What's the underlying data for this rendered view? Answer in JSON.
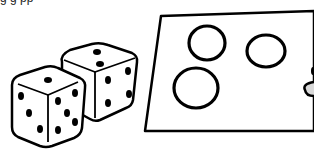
{
  "illustration": {
    "subject": "two dice next to a paper with three circles",
    "top_caption_fragment": "g g pp",
    "dice": [
      {
        "name": "front-die",
        "visible_faces": {
          "top": 1,
          "left": 3,
          "right": 5
        }
      },
      {
        "name": "back-die",
        "visible_faces": {
          "top": 2,
          "right": 4
        }
      }
    ],
    "paper": {
      "circles": 3
    },
    "colors": {
      "stroke": "#000000",
      "fill": "#ffffff",
      "shade": "#d9d9d9"
    }
  }
}
